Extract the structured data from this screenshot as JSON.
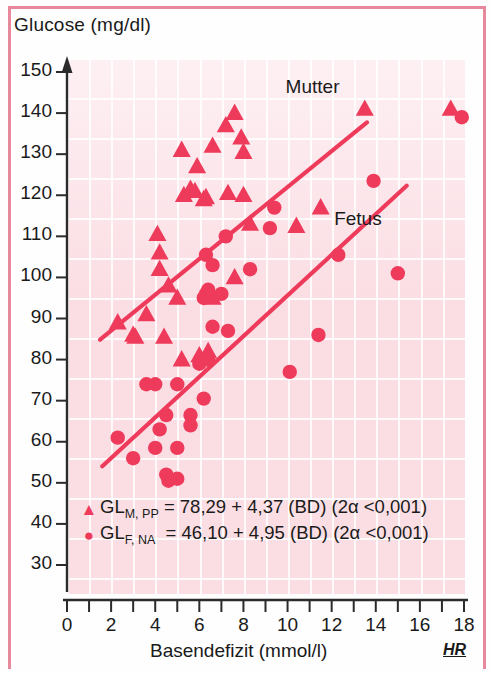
{
  "figure": {
    "ylabel": "Glucose (mg/dl)",
    "xlabel": "Basendefizit (mmol/l)",
    "watermark": "HR",
    "accent_color": "#ef3b5b",
    "background_color": "#fbdde3"
  },
  "legend": {
    "mutter_marker": "▲",
    "fetus_marker": "●",
    "mutter_eq_name": "GL",
    "mutter_eq_sub": "M, PP",
    "mutter_eq_body": "= 78,29 + 4,37 (BD) (2α <0,001)",
    "fetus_eq_name": "GL",
    "fetus_eq_sub": "F, NA",
    "fetus_eq_body": "= 46,10 + 4,95 (BD) (2α <0,001)"
  },
  "chart_data": {
    "type": "scatter",
    "title": "",
    "xlabel": "Basendefizit (mmol/l)",
    "ylabel": "Glucose (mg/dl)",
    "xlim": [
      0,
      18
    ],
    "ylim": [
      30,
      150
    ],
    "xticks": [
      0,
      2,
      4,
      6,
      8,
      10,
      12,
      14,
      16,
      18
    ],
    "xminorticks": [
      1,
      3,
      5,
      7,
      9,
      11,
      13,
      15,
      17
    ],
    "yticks": [
      30,
      40,
      50,
      60,
      70,
      80,
      90,
      100,
      110,
      120,
      130,
      140,
      150
    ],
    "grid": true,
    "legend_position": "inside-bottom-left",
    "annotations": [
      {
        "text": "Mutter",
        "x": 11.0,
        "y": 146.0
      },
      {
        "text": "Fetus",
        "x": 13.2,
        "y": 114.0
      }
    ],
    "series": [
      {
        "name": "Mutter",
        "label": "GL(M, PP)",
        "marker": "triangle",
        "color": "#ef3b5b",
        "fit": {
          "intercept": 78.29,
          "slope": 4.37,
          "significance": "2α <0,001",
          "x_start": 1.5,
          "x_end": 13.6
        },
        "points": [
          [
            4.1,
            110.5
          ],
          [
            4.2,
            106.0
          ],
          [
            4.2,
            102.0
          ],
          [
            4.6,
            98.0
          ],
          [
            5.3,
            120.0
          ],
          [
            5.6,
            121.5
          ],
          [
            5.8,
            121.0
          ],
          [
            6.2,
            119.0
          ],
          [
            6.3,
            119.5
          ],
          [
            5.9,
            127.0
          ],
          [
            5.2,
            131.0
          ],
          [
            6.6,
            132.0
          ],
          [
            7.2,
            137.0
          ],
          [
            7.6,
            140.0
          ],
          [
            7.9,
            134.0
          ],
          [
            8.0,
            130.5
          ],
          [
            7.3,
            120.5
          ],
          [
            8.0,
            120.0
          ],
          [
            8.3,
            113.0
          ],
          [
            10.4,
            112.5
          ],
          [
            11.5,
            117.0
          ],
          [
            13.5,
            141.0
          ],
          [
            17.4,
            141.0
          ],
          [
            2.3,
            89.0
          ],
          [
            3.0,
            86.0
          ],
          [
            3.1,
            85.5
          ],
          [
            3.6,
            91.0
          ],
          [
            4.4,
            85.5
          ],
          [
            5.0,
            95.0
          ],
          [
            5.2,
            80.0
          ],
          [
            6.0,
            81.0
          ],
          [
            6.4,
            82.0
          ],
          [
            6.6,
            95.0
          ],
          [
            7.6,
            100.0
          ]
        ]
      },
      {
        "name": "Fetus",
        "label": "GL(F, NA)",
        "marker": "circle",
        "color": "#ef3b5b",
        "fit": {
          "intercept": 46.1,
          "slope": 4.95,
          "significance": "2α <0,001",
          "x_start": 1.6,
          "x_end": 15.4
        },
        "points": [
          [
            2.3,
            61.0
          ],
          [
            3.0,
            56.0
          ],
          [
            4.0,
            58.5
          ],
          [
            4.5,
            52.0
          ],
          [
            4.6,
            50.5
          ],
          [
            5.0,
            51.0
          ],
          [
            5.0,
            58.5
          ],
          [
            4.2,
            63.0
          ],
          [
            4.5,
            66.5
          ],
          [
            5.0,
            74.0
          ],
          [
            3.6,
            74.0
          ],
          [
            4.0,
            74.0
          ],
          [
            5.6,
            64.0
          ],
          [
            5.6,
            66.5
          ],
          [
            6.2,
            70.5
          ],
          [
            6.0,
            79.0
          ],
          [
            6.4,
            80.0
          ],
          [
            6.6,
            88.0
          ],
          [
            6.2,
            95.0
          ],
          [
            6.3,
            96.0
          ],
          [
            6.4,
            96.5
          ],
          [
            6.4,
            97.0
          ],
          [
            7.0,
            96.0
          ],
          [
            7.3,
            87.0
          ],
          [
            6.3,
            105.5
          ],
          [
            6.6,
            103.0
          ],
          [
            7.2,
            110.0
          ],
          [
            8.3,
            102.0
          ],
          [
            9.2,
            112.0
          ],
          [
            9.4,
            117.0
          ],
          [
            10.1,
            77.0
          ],
          [
            11.4,
            86.0
          ],
          [
            12.3,
            105.5
          ],
          [
            13.9,
            123.5
          ],
          [
            15.0,
            101.0
          ],
          [
            17.9,
            139.0
          ]
        ]
      }
    ]
  }
}
